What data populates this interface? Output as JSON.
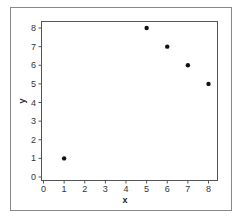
{
  "chart_data": {
    "type": "scatter",
    "title": "",
    "xlabel": "x",
    "ylabel": "y",
    "xlim": [
      0,
      8
    ],
    "ylim": [
      0,
      8
    ],
    "x_ticks": [
      0,
      1,
      2,
      3,
      4,
      5,
      6,
      7,
      8
    ],
    "y_ticks": [
      0,
      1,
      2,
      3,
      4,
      5,
      6,
      7,
      8
    ],
    "grid": false,
    "legend": null,
    "series": [
      {
        "name": "points",
        "color": "#111111",
        "points": [
          {
            "x": 1,
            "y": 1
          },
          {
            "x": 5,
            "y": 8
          },
          {
            "x": 6,
            "y": 7
          },
          {
            "x": 7,
            "y": 6
          },
          {
            "x": 8,
            "y": 5
          }
        ]
      }
    ]
  },
  "colors": {
    "frame": "#777777",
    "axes": "#555555",
    "marker": "#111111"
  }
}
